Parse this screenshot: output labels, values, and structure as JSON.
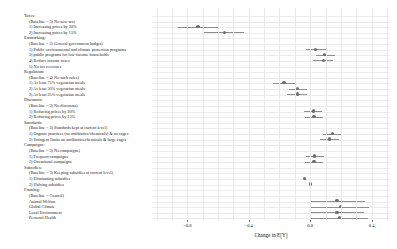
{
  "chart_data": {
    "type": "scatter",
    "title": "",
    "xlabel": "Change in E[Y]",
    "ylabel": "",
    "xlim": [
      -1.03,
      0.52
    ],
    "xticks": [
      -0.8,
      -0.4,
      0.0,
      0.4
    ],
    "xticklabels": [
      "−0.8",
      "−0.4",
      "0.0",
      "0.4"
    ],
    "grid": true,
    "legend": null,
    "reference_line": 0.0,
    "groups": [
      {
        "name": "Taxes:",
        "baseline": "(Baseline = 3) No new tax)",
        "levels": [
          {
            "label": "1) Increasing prices by 30%",
            "estimate": -0.73,
            "ci_low": -0.86,
            "ci_high": -0.6
          },
          {
            "label": "2) Increasing prices by 15%",
            "estimate": -0.56,
            "ci_low": -0.69,
            "ci_high": -0.43
          }
        ]
      },
      {
        "name": "Earmarking:",
        "baseline": "(Baseline = 2) General government budget)",
        "levels": [
          {
            "label": "1) Public environmental and climate protection programs",
            "estimate": 0.035,
            "ci_low": -0.03,
            "ci_high": 0.1
          },
          {
            "label": "3) public programs for low-income households",
            "estimate": 0.095,
            "ci_low": 0.035,
            "ci_high": 0.16
          },
          {
            "label": "4) Reduce income taxes",
            "estimate": 0.085,
            "ci_low": 0.02,
            "ci_high": 0.15
          },
          {
            "label": "5) No tax revenues",
            "estimate": null,
            "ci_low": null,
            "ci_high": null
          }
        ]
      },
      {
        "name": "Regulation:",
        "baseline": "(Baseline = 4) No such rules)",
        "levels": [
          {
            "label": "1) At least 75% vegetarian meals",
            "estimate": -0.17,
            "ci_low": -0.24,
            "ci_high": -0.1
          },
          {
            "label": "2) At least 50% vegetarian meals",
            "estimate": -0.08,
            "ci_low": -0.14,
            "ci_high": -0.02
          },
          {
            "label": "3) At least 25% vegetarian meals",
            "estimate": -0.085,
            "ci_low": -0.15,
            "ci_high": -0.02
          }
        ]
      },
      {
        "name": "Discounts:",
        "baseline": "(Baseline = 3) No discounts)",
        "levels": [
          {
            "label": "1) Reducing prices by 30%",
            "estimate": 0.02,
            "ci_low": -0.04,
            "ci_high": 0.08
          },
          {
            "label": "2) Reducing prices by 15%",
            "estimate": 0.025,
            "ci_low": -0.035,
            "ci_high": 0.085
          }
        ]
      },
      {
        "name": "Standards:",
        "baseline": "(Baseline = 3) Standards kept at current level)",
        "levels": [
          {
            "label": "1) Organic practices (no antibiotics/chemicals) & no cages",
            "estimate": 0.145,
            "ci_low": 0.085,
            "ci_high": 0.205
          },
          {
            "label": "2) Stringent limits on antibiotics/chemicals & large cages",
            "estimate": 0.125,
            "ci_low": 0.065,
            "ci_high": 0.19
          }
        ]
      },
      {
        "name": "Campaigns:",
        "baseline": "(Baseline = 3) No campaigns)",
        "levels": [
          {
            "label": "1) Frequent campaigns",
            "estimate": 0.03,
            "ci_low": -0.03,
            "ci_high": 0.09
          },
          {
            "label": "2) Occasional campaigns",
            "estimate": 0.025,
            "ci_low": -0.035,
            "ci_high": 0.085
          }
        ]
      },
      {
        "name": "Subsidies:",
        "baseline": "(Baseline = 3) Keeping subsidies at current level)",
        "levels": [
          {
            "label": "1) Eliminating subsidies",
            "estimate": -0.035,
            "ci_low": -0.035,
            "ci_high": -0.035
          },
          {
            "label": "2) Halving subsidies",
            "estimate": 0.0,
            "ci_low": 0.0,
            "ci_high": 0.0
          }
        ]
      },
      {
        "name": "Framing:",
        "baseline": "(Baseline = Control)",
        "levels": [
          {
            "label": "Animal Welfare",
            "estimate": 0.175,
            "ci_low": 0.0,
            "ci_high": 0.355
          },
          {
            "label": "Global Climate",
            "estimate": 0.195,
            "ci_low": 0.0,
            "ci_high": 0.385
          },
          {
            "label": "Local Environment",
            "estimate": 0.175,
            "ci_low": 0.0,
            "ci_high": 0.35
          },
          {
            "label": "Personal Health",
            "estimate": 0.19,
            "ci_low": 0.0,
            "ci_high": 0.375
          }
        ]
      }
    ]
  },
  "style": {
    "point_color": "#6f6f6f",
    "ci_color": "#8e8e8e",
    "grid_color": "#ececec",
    "zero_line_color": "#b9b9b9",
    "text_color": "#1a1a1a",
    "background": "#ffffff"
  }
}
